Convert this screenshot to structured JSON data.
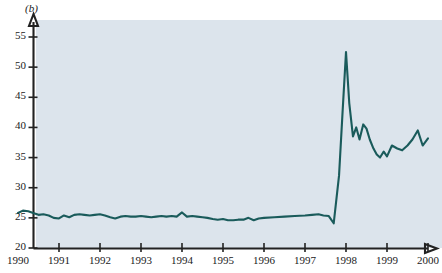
{
  "figure": {
    "panel_label": "(b)",
    "background_color": "#dce4ec",
    "line_color": "#1a5b5b",
    "axis_color": "#222222"
  },
  "chart_data": {
    "type": "line",
    "title": "",
    "subtitle": "",
    "xlabel": "",
    "ylabel": "",
    "xlim": [
      1990,
      2000
    ],
    "ylim": [
      20,
      55
    ],
    "grid": false,
    "legend": null,
    "annotations": [
      "(b)"
    ],
    "xtick_labels": [
      "1990",
      "1991",
      "1992",
      "1993",
      "1994",
      "1995",
      "1996",
      "1997",
      "1998",
      "1999",
      "2000"
    ],
    "xtick_values": [
      1990,
      1991,
      1992,
      1993,
      1994,
      1995,
      1996,
      1997,
      1998,
      1999,
      2000
    ],
    "ytick_labels": [
      "20",
      "25",
      "30",
      "35",
      "40",
      "45",
      "50",
      "55"
    ],
    "ytick_values": [
      20,
      25,
      30,
      35,
      40,
      45,
      50,
      55
    ],
    "series": [
      {
        "name": "series-1",
        "color": "#1a5b5b",
        "x": [
          1990.0,
          1990.12,
          1990.25,
          1990.37,
          1990.5,
          1990.62,
          1990.75,
          1990.87,
          1991.0,
          1991.12,
          1991.25,
          1991.37,
          1991.5,
          1991.62,
          1991.75,
          1991.87,
          1992.0,
          1992.12,
          1992.25,
          1992.37,
          1992.5,
          1992.62,
          1992.75,
          1992.87,
          1993.0,
          1993.12,
          1993.25,
          1993.37,
          1993.5,
          1993.62,
          1993.75,
          1993.87,
          1994.0,
          1994.12,
          1994.25,
          1994.37,
          1994.5,
          1994.62,
          1994.75,
          1994.87,
          1995.0,
          1995.12,
          1995.25,
          1995.37,
          1995.5,
          1995.62,
          1995.75,
          1995.87,
          1996.0,
          1996.25,
          1996.5,
          1996.75,
          1997.0,
          1997.17,
          1997.33,
          1997.45,
          1997.58,
          1997.7,
          1997.83,
          1997.92,
          1998.0,
          1998.08,
          1998.17,
          1998.25,
          1998.33,
          1998.42,
          1998.5,
          1998.58,
          1998.67,
          1998.75,
          1998.83,
          1998.92,
          1999.0,
          1999.12,
          1999.25,
          1999.37,
          1999.5,
          1999.62,
          1999.75,
          1999.87,
          2000.0
        ],
        "y": [
          25.8,
          26.2,
          26.1,
          25.8,
          25.5,
          25.6,
          25.4,
          25.0,
          24.9,
          25.4,
          25.1,
          25.5,
          25.6,
          25.5,
          25.4,
          25.5,
          25.6,
          25.4,
          25.1,
          24.9,
          25.2,
          25.3,
          25.2,
          25.2,
          25.3,
          25.2,
          25.1,
          25.2,
          25.3,
          25.2,
          25.3,
          25.2,
          25.9,
          25.2,
          25.3,
          25.2,
          25.1,
          25.0,
          24.8,
          24.7,
          24.8,
          24.6,
          24.6,
          24.7,
          24.7,
          25.0,
          24.6,
          24.9,
          25.0,
          25.1,
          25.2,
          25.3,
          25.4,
          25.5,
          25.6,
          25.4,
          25.3,
          24.1,
          32.0,
          43.0,
          52.5,
          44.0,
          38.5,
          40.0,
          38.0,
          40.5,
          39.8,
          38.0,
          36.5,
          35.5,
          35.0,
          36.0,
          35.2,
          37.0,
          36.5,
          36.2,
          37.0,
          38.0,
          39.5,
          37.0,
          38.2
        ]
      }
    ]
  }
}
